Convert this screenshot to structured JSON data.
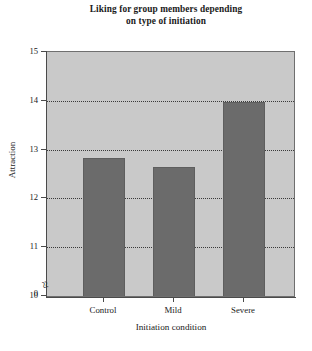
{
  "chart_data": {
    "type": "bar",
    "title": "Liking for group members depending on type of initiation",
    "title_lines": [
      "Liking for group members depending",
      "on type of initiation"
    ],
    "categories": [
      "Control",
      "Mild",
      "Severe"
    ],
    "values": [
      12.83,
      12.65,
      13.98
    ],
    "xlabel": "Initiation condition",
    "ylabel": "Attraction",
    "ylim": [
      10,
      15
    ],
    "y_ticks": [
      10,
      11,
      12,
      13,
      14,
      15
    ],
    "y_tick_labels": [
      "10",
      "11",
      "12",
      "13",
      "14",
      "15"
    ],
    "y_axis_origin_label": "0",
    "axis_break_symbol": "≈",
    "axis_break": true,
    "grid": true,
    "gridlines_at": [
      11,
      12,
      13,
      14
    ],
    "legend": null,
    "legend_position": "none",
    "colors": {
      "bar_fill": "#6b6b6b",
      "bar_edge": "#5e5e5e",
      "plot_background": "#c9c9c9",
      "figure_background": "#ffffff",
      "axis": "#4a4a4a",
      "gridline": "#3a3a3a",
      "text": "#1a1a1a"
    }
  }
}
